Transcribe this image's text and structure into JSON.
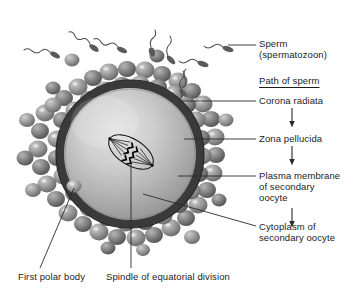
{
  "diagram": {
    "type": "biological-cell-diagram"
  },
  "labels": {
    "sperm_line1": "Sperm",
    "sperm_line2": "(spermatozoon)",
    "path_of_sperm": "Path of sperm",
    "corona_radiata": "Corona radiata",
    "zona_pellucida": "Zona pellucida",
    "plasma_membrane_line1": "Plasma membrane",
    "plasma_membrane_line2": "of secondary",
    "plasma_membrane_line3": "oocyte",
    "cytoplasm_line1": "Cytoplasm of",
    "cytoplasm_line2": "secondary oocyte",
    "first_polar_body": "First polar body",
    "spindle": "Spindle of equatorial division"
  },
  "structures": {
    "zona_pellucida_name": "zona-pellucida-ring",
    "cytoplasm_name": "oocyte-cytoplasm",
    "corona_name": "corona-radiata-cells",
    "sperm_name": "sperm-cells",
    "spindle_name": "mitotic-spindle",
    "polar_body_name": "first-polar-body"
  },
  "colors": {
    "zona_pellucida": "#3a3a3a",
    "cytoplasm_light": "#d8d8d8",
    "cytoplasm_mid": "#b4b4b4",
    "cytoplasm_dark": "#8f8f8f",
    "corona_cell": "#9a9a9a",
    "corona_cell_dark": "#6e6e6e",
    "sperm": "#5a5a5a",
    "leader_line": "#2a2a2a",
    "text": "#1c1c1c",
    "background": "#ffffff"
  }
}
